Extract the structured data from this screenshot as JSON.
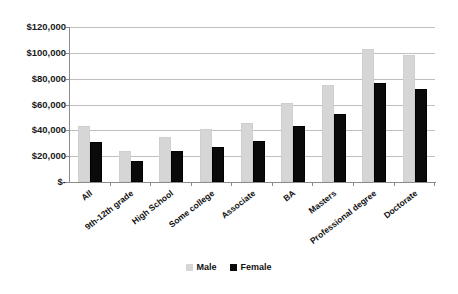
{
  "chart_data": {
    "type": "bar",
    "title": "",
    "subtitle": "",
    "xlabel": "",
    "ylabel": "",
    "ylim": [
      0,
      120000
    ],
    "ytick_labels": [
      "$120,000",
      "$100,000",
      "$80,000",
      "$60,000",
      "$40,000",
      "$20,000",
      "$-"
    ],
    "ytick_values": [
      120000,
      100000,
      80000,
      60000,
      40000,
      20000,
      0
    ],
    "grid": true,
    "grid_axis": "y",
    "legend_position": "bottom-center",
    "categories": [
      "All",
      "9th-12th grade",
      "High School",
      "Some college",
      "Associate",
      "BA",
      "Masters",
      "Professional degree",
      "Doctorate"
    ],
    "series": [
      {
        "name": "Male",
        "color": "#d6d6d6",
        "values": [
          43000,
          24000,
          35000,
          41000,
          46000,
          61000,
          75000,
          103000,
          98000
        ]
      },
      {
        "name": "Female",
        "color": "#0a0a0a",
        "values": [
          31000,
          16000,
          24000,
          27000,
          32000,
          43000,
          53000,
          77000,
          72000
        ]
      }
    ]
  },
  "legend": {
    "items": [
      {
        "label": "Male",
        "swatch": "male-swatch-icon"
      },
      {
        "label": "Female",
        "swatch": "female-swatch-icon"
      }
    ]
  }
}
